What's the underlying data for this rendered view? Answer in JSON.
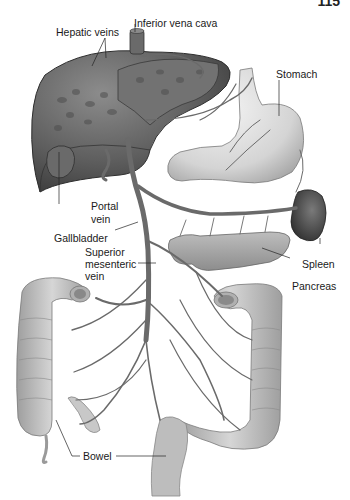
{
  "page": {
    "running_header": "",
    "page_number": "115"
  },
  "diagram": {
    "labels": {
      "hepatic_veins": "Hepatic veins",
      "inferior_vena_cava": "Inferior vena cava",
      "stomach": "Stomach",
      "portal_vein_line1": "Portal",
      "portal_vein_line2": "vein",
      "gallbladder": "Gallbladder",
      "superior_mesenteric_vein_line1": "Superior",
      "superior_mesenteric_vein_line2": "mesenteric",
      "superior_mesenteric_vein_line3": "vein",
      "spleen": "Spleen",
      "pancreas": "Pancreas",
      "bowel": "Bowel"
    },
    "colors": {
      "liver": "#5a5a5a",
      "liver_light": "#8a8a8a",
      "vein": "#6e6e6e",
      "stomach": "#d9d9d9",
      "spleen": "#4a4a4a",
      "pancreas": "#a6a6a6",
      "bowel": "#c4c4c4",
      "leader_line": "#222222"
    }
  }
}
